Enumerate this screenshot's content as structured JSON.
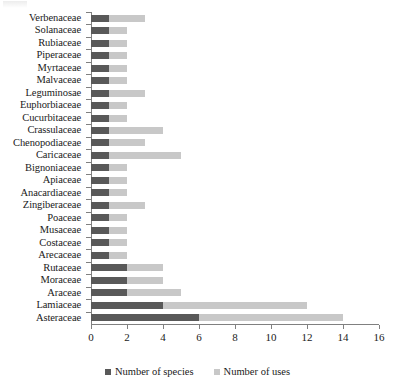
{
  "chart_data": {
    "type": "bar",
    "orientation": "horizontal",
    "stacked": true,
    "title": "",
    "xlabel": "",
    "ylabel": "",
    "xlim": [
      0,
      16
    ],
    "xticks": [
      0,
      2,
      4,
      6,
      8,
      10,
      12,
      14,
      16
    ],
    "grid": false,
    "legend_position": "bottom",
    "categories": [
      "Verbenaceae",
      "Solanaceae",
      "Rubiaceae",
      "Piperaceae",
      "Myrtaceae",
      "Malvaceae",
      "Leguminosae",
      "Euphorbiaceae",
      "Cucurbitaceae",
      "Crassulaceae",
      "Chenopodiaceae",
      "Caricaceae",
      "Bignoniaceae",
      "Apiaceae",
      "Anacardiaceae",
      "Zingiberaceae",
      "Poaceae",
      "Musaceae",
      "Costaceae",
      "Arecaceae",
      "Rutaceae",
      "Moraceae",
      "Araceae",
      "Lamiaceae",
      "Asteraceae"
    ],
    "series": [
      {
        "name": "Number of species",
        "color": "#595959",
        "values": [
          1,
          1,
          1,
          1,
          1,
          1,
          1,
          1,
          1,
          1,
          1,
          1,
          1,
          1,
          1,
          1,
          1,
          1,
          1,
          1,
          2,
          2,
          2,
          4,
          6
        ]
      },
      {
        "name": "Number of uses",
        "color": "#c8c8c8",
        "values": [
          3,
          2,
          2,
          2,
          2,
          2,
          3,
          2,
          2,
          4,
          3,
          5,
          2,
          2,
          2,
          3,
          2,
          2,
          2,
          2,
          4,
          4,
          5,
          12,
          14
        ]
      }
    ]
  },
  "legend": {
    "items": [
      {
        "label": "Number of species",
        "color": "#595959"
      },
      {
        "label": "Number of uses",
        "color": "#c8c8c8"
      }
    ]
  }
}
